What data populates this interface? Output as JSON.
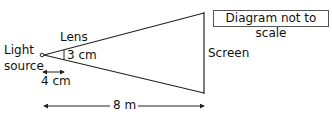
{
  "diagram": {
    "note": "Diagram not to scale",
    "labels": {
      "light_source_line1": "Light",
      "light_source_line2": "source",
      "lens": "Lens",
      "screen": "Screen",
      "lens_height": "3 cm",
      "lens_distance": "4 cm",
      "screen_distance": "8 m"
    },
    "colors": {
      "stroke": "#222222",
      "text": "#111111",
      "note_border": "#555555"
    }
  }
}
